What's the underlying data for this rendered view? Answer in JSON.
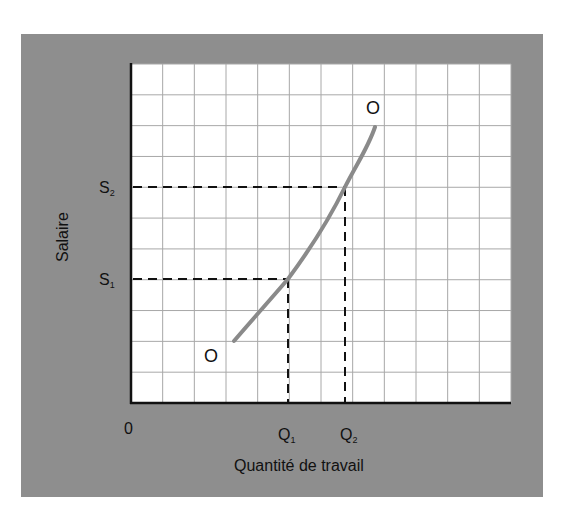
{
  "chart_data": {
    "type": "line",
    "title": "",
    "xlabel": "Quantité de travail",
    "ylabel": "Salaire",
    "origin_label": "0",
    "grid": true,
    "grid_columns": 12,
    "grid_rows": 11,
    "xlim": [
      0,
      12
    ],
    "ylim": [
      0,
      11
    ],
    "x_ticks": [
      {
        "label": "Q",
        "sub": "1",
        "value": 5.0
      },
      {
        "label": "Q",
        "sub": "2",
        "value": 6.8
      }
    ],
    "y_ticks": [
      {
        "label": "S",
        "sub": "1",
        "value": 4.0
      },
      {
        "label": "S",
        "sub": "2",
        "value": 7.0
      }
    ],
    "series": [
      {
        "name": "O",
        "x": [
          3.3,
          4.0,
          5.0,
          6.0,
          6.8,
          7.3,
          7.8
        ],
        "y": [
          2.0,
          2.9,
          4.0,
          5.4,
          7.0,
          8.2,
          9.0
        ],
        "color": "#8a8a8a"
      }
    ],
    "annotations": [
      {
        "text": "O",
        "x": 2.7,
        "y": 1.5,
        "position": "curve-start"
      },
      {
        "text": "O",
        "x": 7.8,
        "y": 9.6,
        "position": "curve-end"
      }
    ],
    "reference_lines": [
      {
        "from": [
          0,
          4.0
        ],
        "to": [
          5.0,
          4.0
        ],
        "style": "dashed"
      },
      {
        "from": [
          5.0,
          0
        ],
        "to": [
          5.0,
          4.0
        ],
        "style": "dashed"
      },
      {
        "from": [
          0,
          7.0
        ],
        "to": [
          6.8,
          7.0
        ],
        "style": "dashed"
      },
      {
        "from": [
          6.8,
          0
        ],
        "to": [
          6.8,
          7.0
        ],
        "style": "dashed"
      }
    ],
    "legend": "none"
  },
  "labels": {
    "ylabel": "Salaire",
    "xlabel": "Quantité de travail",
    "origin": "0",
    "s1": "S",
    "s1_sub": "1",
    "s2": "S",
    "s2_sub": "2",
    "q1": "Q",
    "q1_sub": "1",
    "q2": "Q",
    "q2_sub": "2",
    "curve_start": "O",
    "curve_end": "O"
  },
  "colors": {
    "panel": "#8e8e8e",
    "plot_bg": "#ffffff",
    "grid": "#a8a8a8",
    "axis": "#111111",
    "curve": "#8a8a8a",
    "dash": "#111111"
  }
}
